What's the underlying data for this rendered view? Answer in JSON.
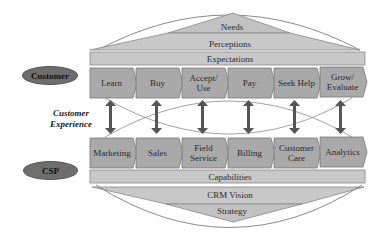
{
  "colors": {
    "box_fill": "#a9a9a9",
    "box_stroke": "#777777",
    "band_fill": "#c8c8c8",
    "arrow": "#555555",
    "ellipse_stroke": "#8a8a8a",
    "actor_fill": "#6e6e6e"
  },
  "actors": {
    "customer": "Customer",
    "csp": "CSP"
  },
  "middle_label": {
    "line1": "Customer",
    "line2": "Experience"
  },
  "customer_side": {
    "pyramid": {
      "needs": "Needs",
      "perceptions": "Perceptions",
      "expectations": "Expectations"
    },
    "stages": [
      {
        "line1": "Learn",
        "line2": ""
      },
      {
        "line1": "Buy",
        "line2": ""
      },
      {
        "line1": "Accept/",
        "line2": "Use"
      },
      {
        "line1": "Pay",
        "line2": ""
      },
      {
        "line1": "Seek Help",
        "line2": ""
      },
      {
        "line1": "Grow/",
        "line2": "Evaluate"
      }
    ]
  },
  "csp_side": {
    "functions": [
      {
        "line1": "Marketing",
        "line2": ""
      },
      {
        "line1": "Sales",
        "line2": ""
      },
      {
        "line1": "Field",
        "line2": "Service"
      },
      {
        "line1": "Billing",
        "line2": ""
      },
      {
        "line1": "Customer",
        "line2": "Care"
      },
      {
        "line1": "Analytics",
        "line2": ""
      }
    ],
    "pyramid": {
      "capabilities": "Capabilities",
      "crm_vision": "CRM Vision",
      "strategy": "Strategy"
    }
  }
}
